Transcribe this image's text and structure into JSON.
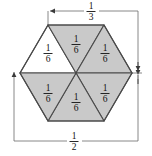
{
  "figure": {
    "canvas": {
      "width": 152,
      "height": 156,
      "background": "#ffffff"
    },
    "colors": {
      "shaded_fill": "#c9c9c9",
      "unshaded_fill": "#ffffff",
      "outline": "#4a4a4a",
      "dimension_line": "#5a5a5a",
      "text": "#111111"
    },
    "hexagon": {
      "center": {
        "x": 76,
        "y": 73
      },
      "vertices": [
        {
          "name": "left",
          "x": 20,
          "y": 73
        },
        {
          "name": "top-left",
          "x": 48,
          "y": 25
        },
        {
          "name": "top-right",
          "x": 104,
          "y": 25
        },
        {
          "name": "right",
          "x": 132,
          "y": 73
        },
        {
          "name": "bottom-right",
          "x": 104,
          "y": 121
        },
        {
          "name": "bottom-left",
          "x": 48,
          "y": 121
        }
      ]
    },
    "triangles": [
      {
        "id": "top-left",
        "label_numerator": "1",
        "label_denominator": "6",
        "shaded": false,
        "label_x": 48,
        "label_y": 53
      },
      {
        "id": "top-right",
        "label_numerator": "1",
        "label_denominator": "6",
        "shaded": true,
        "label_x": 76,
        "label_y": 44
      },
      {
        "id": "right-upper",
        "label_numerator": "1",
        "label_denominator": "6",
        "shaded": true,
        "label_x": 105,
        "label_y": 53
      },
      {
        "id": "right-lower",
        "label_numerator": "1",
        "label_denominator": "6",
        "shaded": true,
        "label_x": 105,
        "label_y": 93
      },
      {
        "id": "bottom",
        "label_numerator": "1",
        "label_denominator": "6",
        "shaded": true,
        "label_x": 76,
        "label_y": 102
      },
      {
        "id": "left-lower",
        "label_numerator": "1",
        "label_denominator": "6",
        "shaded": true,
        "label_x": 48,
        "label_y": 93
      }
    ],
    "dimensions": [
      {
        "id": "top-width",
        "label_numerator": "1",
        "label_denominator": "3",
        "orientation": "horizontal",
        "label_x": 91,
        "label_y": 11,
        "line_y": 11,
        "from_x": 48,
        "to_x": 138
      },
      {
        "id": "bottom-width",
        "label_numerator": "1",
        "label_denominator": "2",
        "orientation": "horizontal",
        "label_x": 74,
        "label_y": 141,
        "line_y": 141,
        "from_x": 14,
        "to_x": 138
      },
      {
        "id": "right-height",
        "label_numerator": "",
        "label_denominator": "",
        "orientation": "vertical",
        "line_x": 138,
        "from_y": 11,
        "to_y": 141
      }
    ]
  }
}
